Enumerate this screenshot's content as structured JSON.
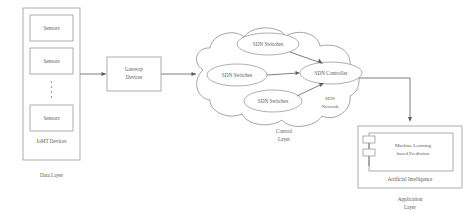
{
  "diagram": {
    "colors": {
      "stroke": "#8d8d8d",
      "text": "#5a5a5a",
      "arrow": "#5d5d5d",
      "background": "#ffffff"
    },
    "data_layer": {
      "container_label": "IoMT Devices",
      "layer_label": "Data Layer",
      "sensors": [
        {
          "label": "Sensors"
        },
        {
          "label": "Sensors"
        },
        {
          "label": "Sensors"
        }
      ],
      "ellipsis": "⋮"
    },
    "gateway": {
      "label_line1": "Gateway",
      "label_line2": "Devices"
    },
    "control_layer": {
      "layer_label_line1": "Control",
      "layer_label_line2": "Layer",
      "network_label_line1": "SDN",
      "network_label_line2": "Network",
      "nodes": [
        {
          "label": "SDN Switches"
        },
        {
          "label": "SDN Switches"
        },
        {
          "label": "SDN Switches"
        },
        {
          "label": "SDN Controller"
        }
      ]
    },
    "application_layer": {
      "layer_label_line1": "Application",
      "layer_label_line2": "Layer",
      "container_label": "Artificial Intelligence",
      "ml_label_line1": "Machine Learning",
      "ml_label_line2": "based Prediction"
    }
  }
}
